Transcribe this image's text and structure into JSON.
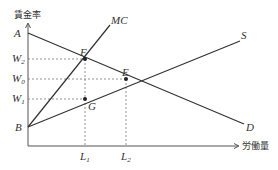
{
  "diagram": {
    "y_axis_label": "賃金率",
    "x_axis_label": "労働量",
    "curves": {
      "mc": "MC",
      "supply": "S",
      "demand": "D"
    },
    "points": {
      "a": "A",
      "b": "B",
      "e": "E",
      "f": "F",
      "g": "G"
    },
    "wage_labels": {
      "w2": {
        "base": "W",
        "sub": "2"
      },
      "w0": {
        "base": "W",
        "sub": "0"
      },
      "w1": {
        "base": "W",
        "sub": "1"
      }
    },
    "quantity_labels": {
      "l1": {
        "base": "L",
        "sub": "1"
      },
      "l2": {
        "base": "L",
        "sub": "2"
      }
    },
    "colors": {
      "line": "#333333",
      "dash": "#777777"
    }
  }
}
